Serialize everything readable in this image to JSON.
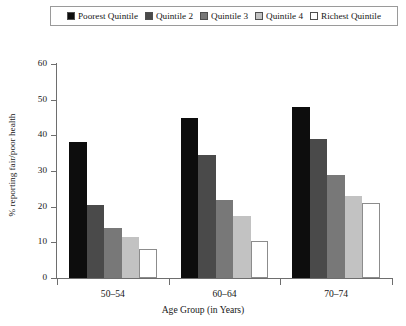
{
  "chart_data": {
    "type": "bar",
    "title": "",
    "subtitle": "",
    "xlabel": "Age Group (in Years)",
    "ylabel": "% reporting fair/poor health",
    "categories": [
      "50–54",
      "60–64",
      "70–74"
    ],
    "series": [
      {
        "name": "Poorest Quintile",
        "color": "#0d0d0d",
        "values": [
          38,
          45,
          48
        ]
      },
      {
        "name": "Quintile 2",
        "color": "#4a4a4a",
        "values": [
          20.5,
          34.5,
          39
        ]
      },
      {
        "name": "Quintile 3",
        "color": "#787878",
        "values": [
          14,
          22,
          29
        ]
      },
      {
        "name": "Quintile 4",
        "color": "#c2c2c2",
        "values": [
          11.5,
          17.5,
          23
        ]
      },
      {
        "name": "Richest Quintile",
        "color": "#ffffff",
        "values": [
          8,
          10.5,
          21
        ]
      }
    ],
    "ylim": [
      0,
      60
    ],
    "yticks": [
      0,
      10,
      20,
      30,
      40,
      50,
      60
    ],
    "ytick_labels": [
      "0",
      "10",
      "20",
      "30",
      "40",
      "50",
      "60"
    ],
    "grid": false,
    "legend_position": "top"
  },
  "legend": {
    "items": [
      {
        "label": "Poorest Quintile"
      },
      {
        "label": "Quintile 2"
      },
      {
        "label": "Quintile 3"
      },
      {
        "label": "Quintile 4"
      },
      {
        "label": "Richest Quintile"
      }
    ]
  }
}
